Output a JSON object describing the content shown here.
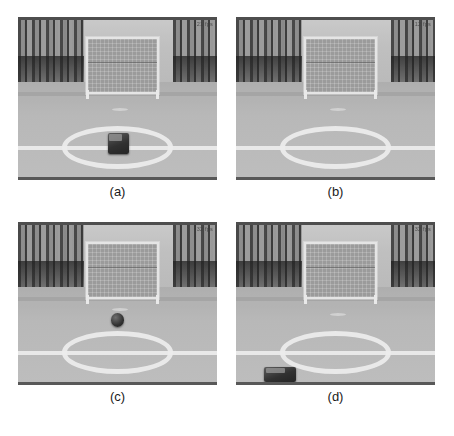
{
  "figure": {
    "layout": "2x2 grid of grayscale video frames",
    "background_color": "#ffffff"
  },
  "panels": [
    {
      "id": "panel-a",
      "caption": "(a)",
      "overlay_fps": "21 fps",
      "scene": {
        "description": "Robot soccer field with goal, centre circle and a dark robot standing on the centre spot",
        "objects": [
          "goal",
          "center-circle",
          "half-line",
          "penalty-mark",
          "robot"
        ]
      }
    },
    {
      "id": "panel-b",
      "caption": "(b)",
      "overlay_fps": "12 fps",
      "scene": {
        "description": "Same field, empty centre circle, no robot or ball visible",
        "objects": [
          "goal",
          "center-circle",
          "half-line",
          "penalty-mark"
        ]
      }
    },
    {
      "id": "panel-c",
      "caption": "(c)",
      "overlay_fps": "32 fps",
      "scene": {
        "description": "Same field with a small dark ball above the centre circle",
        "objects": [
          "goal",
          "center-circle",
          "half-line",
          "penalty-mark",
          "ball"
        ]
      }
    },
    {
      "id": "panel-d",
      "caption": "(d)",
      "overlay_fps": "32 fps",
      "scene": {
        "description": "Same field with a dark rectangular robot near the bottom edge of the frame",
        "objects": [
          "goal",
          "center-circle",
          "half-line",
          "penalty-mark",
          "robot"
        ]
      }
    }
  ],
  "colors": {
    "pitch": "#bdbdbd",
    "line_white": "#f4f4f4",
    "object_dark": "#2a2a2a",
    "frame_border": "#4a4a4a",
    "caption_text": "#1a1a1a"
  }
}
